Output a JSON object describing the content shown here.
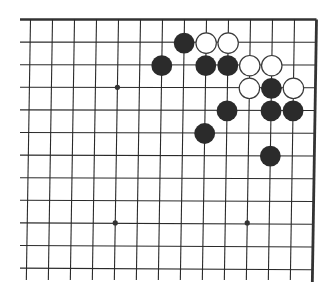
{
  "board": {
    "type": "go-diagram",
    "view": "upper-right corner",
    "columns_visible": 14,
    "rows_visible": 12,
    "edges": [
      "top",
      "right"
    ],
    "colors": {
      "line": "#2a2a2a",
      "edge": "#333333",
      "black_stone": "#2b2b2b",
      "white_stone": "#ffffff",
      "white_stone_border": "#3a3a3a",
      "star_point": "#333333",
      "background": "#ffffff"
    },
    "star_points": [
      {
        "col": 4,
        "row": 3
      },
      {
        "col": 4,
        "row": 9
      },
      {
        "col": 10,
        "row": 9
      }
    ],
    "stones": [
      {
        "color": "black",
        "col": 7,
        "row": 1
      },
      {
        "color": "white",
        "col": 8,
        "row": 1
      },
      {
        "color": "white",
        "col": 9,
        "row": 1
      },
      {
        "color": "black",
        "col": 6,
        "row": 2
      },
      {
        "color": "black",
        "col": 8,
        "row": 2
      },
      {
        "color": "black",
        "col": 9,
        "row": 2
      },
      {
        "color": "white",
        "col": 10,
        "row": 2
      },
      {
        "color": "white",
        "col": 11,
        "row": 2
      },
      {
        "color": "white",
        "col": 10,
        "row": 3
      },
      {
        "color": "black",
        "col": 11,
        "row": 3
      },
      {
        "color": "white",
        "col": 12,
        "row": 3
      },
      {
        "color": "black",
        "col": 9,
        "row": 4
      },
      {
        "color": "black",
        "col": 11,
        "row": 4
      },
      {
        "color": "black",
        "col": 12,
        "row": 4
      },
      {
        "color": "black",
        "col": 8,
        "row": 5
      },
      {
        "color": "black",
        "col": 11,
        "row": 6
      }
    ]
  }
}
